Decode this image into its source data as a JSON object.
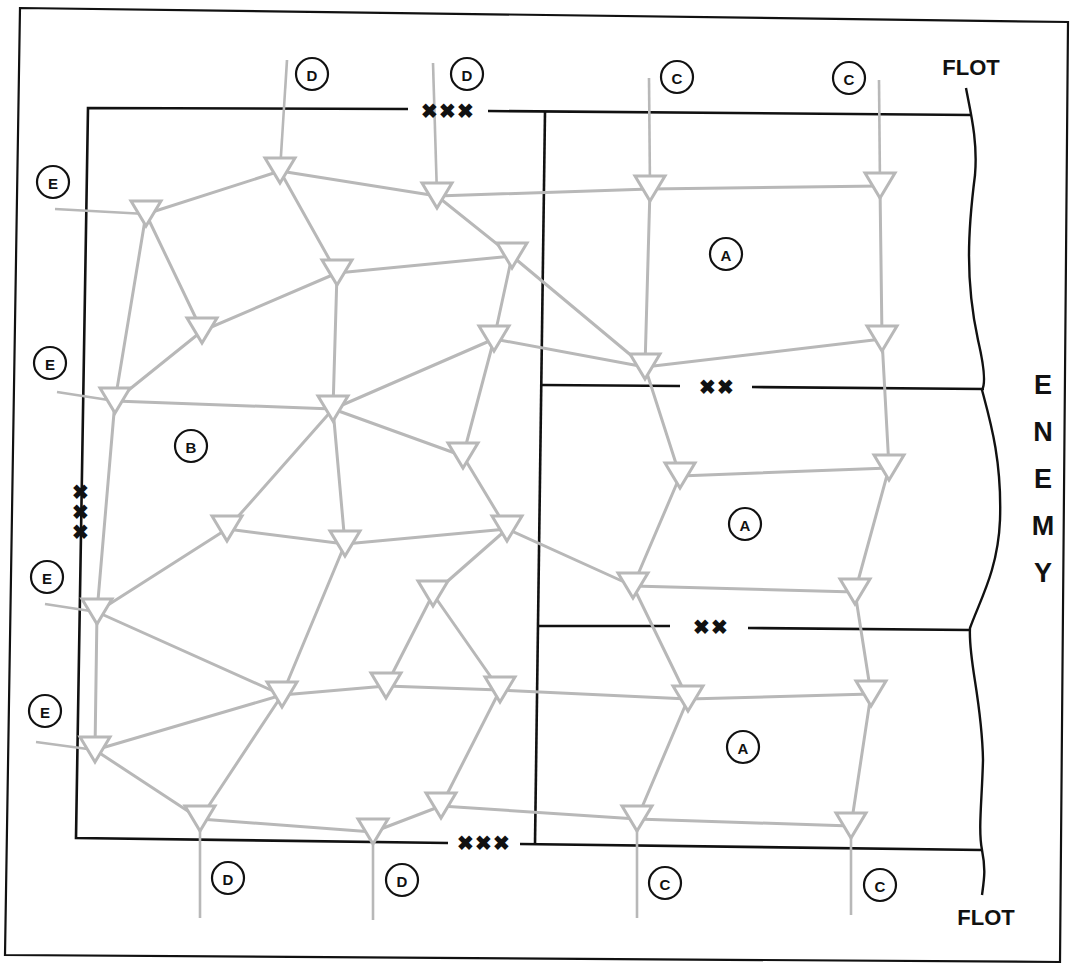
{
  "diagram": {
    "colors": {
      "line": "#111111",
      "network": "#b8b8b8",
      "background": "#ffffff"
    },
    "labels": {
      "flot_top": "FLOT",
      "flot_bottom": "FLOT",
      "enemy": [
        "E",
        "N",
        "E",
        "M",
        "Y"
      ]
    },
    "boundary_markers": [
      {
        "id": "corps-top",
        "text": "XXX",
        "x": 448,
        "y": 111,
        "orientation": "horizontal"
      },
      {
        "id": "corps-bottom",
        "text": "XXX",
        "x": 484,
        "y": 843,
        "orientation": "horizontal"
      },
      {
        "id": "corps-left",
        "text": "XXX",
        "x": 81,
        "y": 512,
        "orientation": "vertical"
      },
      {
        "id": "division-upper",
        "text": "XX",
        "x": 717,
        "y": 387,
        "orientation": "horizontal"
      },
      {
        "id": "division-lower",
        "text": "XX",
        "x": 711,
        "y": 627,
        "orientation": "horizontal"
      }
    ],
    "callouts": [
      {
        "letter": "D",
        "x": 312,
        "y": 74
      },
      {
        "letter": "D",
        "x": 467,
        "y": 74
      },
      {
        "letter": "C",
        "x": 677,
        "y": 77
      },
      {
        "letter": "C",
        "x": 849,
        "y": 78
      },
      {
        "letter": "E",
        "x": 53,
        "y": 182
      },
      {
        "letter": "E",
        "x": 50,
        "y": 363
      },
      {
        "letter": "E",
        "x": 47,
        "y": 577
      },
      {
        "letter": "E",
        "x": 45,
        "y": 711
      },
      {
        "letter": "A",
        "x": 726,
        "y": 254
      },
      {
        "letter": "A",
        "x": 745,
        "y": 524
      },
      {
        "letter": "A",
        "x": 743,
        "y": 747
      },
      {
        "letter": "B",
        "x": 191,
        "y": 446
      },
      {
        "letter": "D",
        "x": 228,
        "y": 878
      },
      {
        "letter": "D",
        "x": 402,
        "y": 880
      },
      {
        "letter": "C",
        "x": 665,
        "y": 883
      },
      {
        "letter": "C",
        "x": 880,
        "y": 885
      }
    ],
    "nodes": [
      {
        "id": "n1",
        "x": 280,
        "y": 162
      },
      {
        "id": "n2",
        "x": 437,
        "y": 187
      },
      {
        "id": "n3",
        "x": 650,
        "y": 180
      },
      {
        "id": "n4",
        "x": 880,
        "y": 177
      },
      {
        "id": "n5",
        "x": 146,
        "y": 205
      },
      {
        "id": "n6",
        "x": 337,
        "y": 264
      },
      {
        "id": "n7",
        "x": 512,
        "y": 247
      },
      {
        "id": "n8",
        "x": 202,
        "y": 322
      },
      {
        "id": "n9",
        "x": 494,
        "y": 330
      },
      {
        "id": "n10",
        "x": 645,
        "y": 358
      },
      {
        "id": "n11",
        "x": 882,
        "y": 330
      },
      {
        "id": "n12",
        "x": 115,
        "y": 392
      },
      {
        "id": "n13",
        "x": 333,
        "y": 400
      },
      {
        "id": "n14",
        "x": 463,
        "y": 447
      },
      {
        "id": "n15",
        "x": 680,
        "y": 467
      },
      {
        "id": "n16",
        "x": 889,
        "y": 459
      },
      {
        "id": "n17",
        "x": 227,
        "y": 520
      },
      {
        "id": "n18",
        "x": 345,
        "y": 535
      },
      {
        "id": "n19",
        "x": 507,
        "y": 520
      },
      {
        "id": "n20",
        "x": 633,
        "y": 577
      },
      {
        "id": "n21",
        "x": 855,
        "y": 583
      },
      {
        "id": "n22",
        "x": 97,
        "y": 603
      },
      {
        "id": "n23",
        "x": 433,
        "y": 585
      },
      {
        "id": "n24",
        "x": 282,
        "y": 686
      },
      {
        "id": "n25",
        "x": 386,
        "y": 677
      },
      {
        "id": "n26",
        "x": 500,
        "y": 681
      },
      {
        "id": "n27",
        "x": 688,
        "y": 690
      },
      {
        "id": "n28",
        "x": 871,
        "y": 685
      },
      {
        "id": "n29",
        "x": 95,
        "y": 741
      },
      {
        "id": "n30",
        "x": 200,
        "y": 810
      },
      {
        "id": "n31",
        "x": 373,
        "y": 823
      },
      {
        "id": "n32",
        "x": 441,
        "y": 797
      },
      {
        "id": "n33",
        "x": 637,
        "y": 810
      },
      {
        "id": "n34",
        "x": 851,
        "y": 817
      }
    ],
    "edges": [
      [
        "n5",
        "n1"
      ],
      [
        "n1",
        "n2"
      ],
      [
        "n2",
        "n3"
      ],
      [
        "n3",
        "n4"
      ],
      [
        "n1",
        "n6"
      ],
      [
        "n2",
        "n7"
      ],
      [
        "n5",
        "n8"
      ],
      [
        "n5",
        "n12"
      ],
      [
        "n6",
        "n7"
      ],
      [
        "n6",
        "n8"
      ],
      [
        "n6",
        "n13"
      ],
      [
        "n7",
        "n9"
      ],
      [
        "n7",
        "n10"
      ],
      [
        "n3",
        "n10"
      ],
      [
        "n4",
        "n11"
      ],
      [
        "n8",
        "n12"
      ],
      [
        "n9",
        "n10"
      ],
      [
        "n10",
        "n11"
      ],
      [
        "n12",
        "n13"
      ],
      [
        "n9",
        "n13"
      ],
      [
        "n9",
        "n14"
      ],
      [
        "n13",
        "n14"
      ],
      [
        "n10",
        "n15"
      ],
      [
        "n11",
        "n16"
      ],
      [
        "n15",
        "n16"
      ],
      [
        "n13",
        "n17"
      ],
      [
        "n13",
        "n18"
      ],
      [
        "n14",
        "n19"
      ],
      [
        "n17",
        "n22"
      ],
      [
        "n17",
        "n18"
      ],
      [
        "n18",
        "n19"
      ],
      [
        "n12",
        "n22"
      ],
      [
        "n19",
        "n20"
      ],
      [
        "n19",
        "n23"
      ],
      [
        "n15",
        "n20"
      ],
      [
        "n16",
        "n21"
      ],
      [
        "n20",
        "n21"
      ],
      [
        "n22",
        "n24"
      ],
      [
        "n22",
        "n29"
      ],
      [
        "n18",
        "n24"
      ],
      [
        "n23",
        "n25"
      ],
      [
        "n23",
        "n26"
      ],
      [
        "n24",
        "n25"
      ],
      [
        "n25",
        "n26"
      ],
      [
        "n26",
        "n27"
      ],
      [
        "n20",
        "n27"
      ],
      [
        "n21",
        "n28"
      ],
      [
        "n27",
        "n28"
      ],
      [
        "n24",
        "n29"
      ],
      [
        "n24",
        "n30"
      ],
      [
        "n29",
        "n30"
      ],
      [
        "n30",
        "n31"
      ],
      [
        "n31",
        "n32"
      ],
      [
        "n26",
        "n32"
      ],
      [
        "n32",
        "n33"
      ],
      [
        "n27",
        "n33"
      ],
      [
        "n28",
        "n34"
      ],
      [
        "n33",
        "n34"
      ]
    ],
    "feeds": [
      {
        "from": [
          287,
          60
        ],
        "to": "n1"
      },
      {
        "from": [
          433,
          63
        ],
        "to": "n2"
      },
      {
        "from": [
          649,
          78
        ],
        "to": "n3"
      },
      {
        "from": [
          879,
          80
        ],
        "to": "n4"
      },
      {
        "from": [
          55,
          209
        ],
        "to": "n5"
      },
      {
        "from": [
          57,
          392
        ],
        "to": "n12"
      },
      {
        "from": [
          45,
          604
        ],
        "to": "n22"
      },
      {
        "from": [
          36,
          742
        ],
        "to": "n29"
      },
      {
        "from": [
          200,
          918
        ],
        "to": "n30"
      },
      {
        "from": [
          373,
          920
        ],
        "to": "n31"
      },
      {
        "from": [
          637,
          918
        ],
        "to": "n33"
      },
      {
        "from": [
          851,
          915
        ],
        "to": "n34"
      }
    ]
  }
}
